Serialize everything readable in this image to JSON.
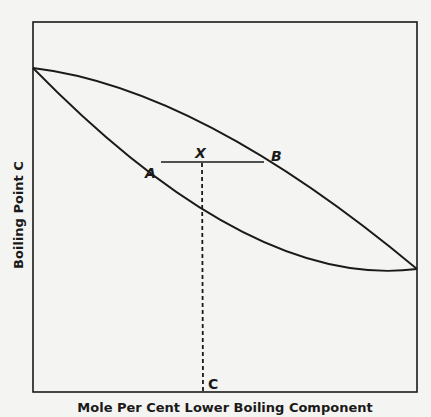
{
  "diagram": {
    "type": "boiling-point phase diagram (binary mixture)",
    "x_axis_label": "Mole Per Cent Lower Boiling Component",
    "y_axis_label": "Boiling Point C",
    "curves": [
      {
        "name": "vapor curve (upper, concave)",
        "from": "left boiling point",
        "to": "right boiling point"
      },
      {
        "name": "liquid curve (lower, convex)",
        "from": "left boiling point",
        "to": "right boiling point"
      }
    ],
    "points": {
      "A": "A",
      "B": "B",
      "X": "X",
      "C": "C"
    },
    "tie_line": {
      "from": "A",
      "to": "B",
      "through": "X"
    },
    "dashed_line": {
      "from": "X",
      "to": "C"
    }
  },
  "colors": {
    "background": "#f4f4f2",
    "ink": "#1a1a1a"
  }
}
